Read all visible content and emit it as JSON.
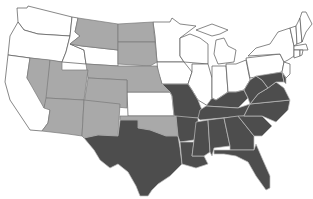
{
  "map": {
    "title": "",
    "type": "choropleth",
    "region": "Contiguous United States",
    "legend": [],
    "colors": {
      "background": "#ffffff",
      "category_none": "#ffffff",
      "category_light": "#a9a9a9",
      "category_dark": "#4d4d4d",
      "border_on_white": "#555555",
      "border_on_light": "#7a7a7a",
      "border_on_dark": "#bdbdbd"
    },
    "categories": {
      "light": [
        "Montana",
        "North Dakota",
        "South Dakota",
        "Nebraska",
        "Nevada",
        "Utah",
        "Colorado",
        "Arizona",
        "New Mexico",
        "Oklahoma"
      ],
      "dark": [
        "Texas",
        "Missouri",
        "Arkansas",
        "Louisiana",
        "Kentucky",
        "Tennessee",
        "Mississippi",
        "Alabama",
        "Georgia",
        "Florida",
        "South Carolina",
        "North Carolina",
        "Virginia",
        "West Virginia",
        "Maryland",
        "Delaware"
      ],
      "none": [
        "Washington",
        "Oregon",
        "California",
        "Idaho",
        "Wyoming",
        "Kansas",
        "Minnesota",
        "Iowa",
        "Wisconsin",
        "Illinois",
        "Michigan",
        "Indiana",
        "Ohio",
        "Pennsylvania",
        "New York",
        "New Jersey",
        "Connecticut",
        "Rhode Island",
        "Massachusetts",
        "Vermont",
        "New Hampshire",
        "Maine"
      ]
    }
  }
}
